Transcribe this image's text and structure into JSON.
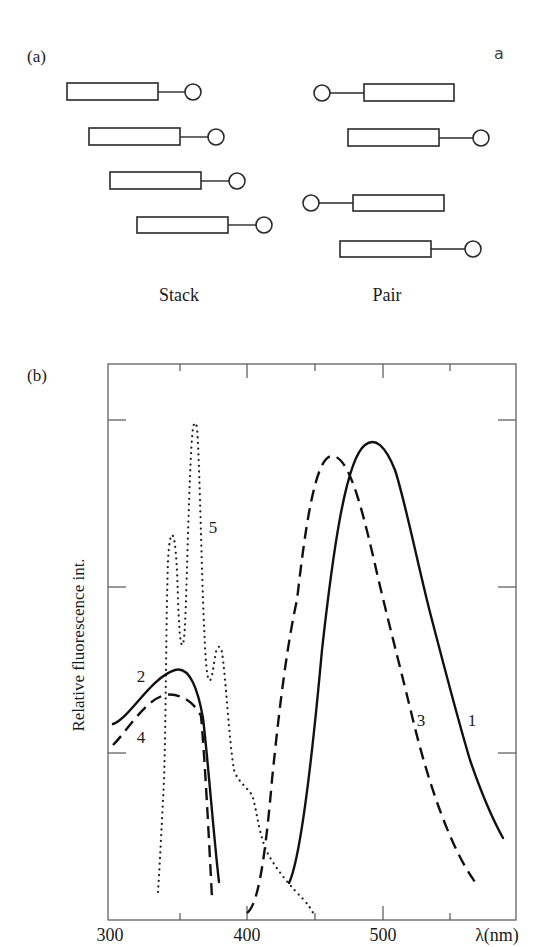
{
  "panel_a": {
    "label": "(a)",
    "corner_mark": "a",
    "stack_caption": "Stack",
    "pair_caption": "Pair",
    "stack_units": [
      {
        "rect": [
          67,
          83,
          91,
          17
        ],
        "bead": [
          193,
          92
        ],
        "bead_side": "right"
      },
      {
        "rect": [
          89,
          128,
          91,
          17
        ],
        "bead": [
          216,
          137
        ],
        "bead_side": "right"
      },
      {
        "rect": [
          110,
          172,
          91,
          17
        ],
        "bead": [
          237,
          181
        ],
        "bead_side": "right"
      },
      {
        "rect": [
          137,
          217,
          91,
          16
        ],
        "bead": [
          264,
          225
        ],
        "bead_side": "right"
      }
    ],
    "pair_units": [
      {
        "rect": [
          364,
          84,
          90,
          17
        ],
        "bead": [
          322,
          93
        ],
        "bead_side": "left"
      },
      {
        "rect": [
          348,
          129,
          91,
          17
        ],
        "bead": [
          481,
          138
        ],
        "bead_side": "right"
      },
      {
        "rect": [
          353,
          195,
          91,
          16
        ],
        "bead": [
          311,
          203
        ],
        "bead_side": "left"
      },
      {
        "rect": [
          340,
          241,
          91,
          16
        ],
        "bead": [
          473,
          249
        ],
        "bead_side": "right"
      }
    ]
  },
  "panel_b": {
    "label": "(b)",
    "ylabel": "Relative fluorescence int.",
    "xlabel": "λ(nm)",
    "x_tick_labels": [
      "300",
      "400",
      "500"
    ],
    "curve_labels": [
      "1",
      "2",
      "3",
      "4",
      "5"
    ]
  },
  "chart_data": {
    "type": "line",
    "title": "",
    "xlabel": "λ(nm)",
    "ylabel": "Relative fluorescence int.",
    "xlim": [
      300,
      600
    ],
    "ylim": [
      0,
      3.33
    ],
    "x_ticks_major": [
      300,
      400,
      500
    ],
    "x_ticks_minor": [
      350,
      450,
      550
    ],
    "y_ticks": [
      1,
      2,
      3
    ],
    "y_tick_labels": [],
    "grid": false,
    "legend": "inline curve numbers",
    "series": [
      {
        "name": "1",
        "style": "solid",
        "x": [
          433,
          460,
          495,
          522,
          538,
          559,
          590
        ],
        "y": [
          0.22,
          1.8,
          2.87,
          2.4,
          1.8,
          1.2,
          0.49
        ]
      },
      {
        "name": "2",
        "style": "solid",
        "x": [
          304,
          330,
          351,
          369,
          382
        ],
        "y": [
          1.18,
          1.38,
          1.5,
          1.21,
          0.23
        ]
      },
      {
        "name": "3",
        "style": "dashed",
        "x": [
          402,
          419,
          439,
          465,
          507,
          524,
          570
        ],
        "y": [
          0.04,
          0.84,
          1.8,
          2.78,
          1.77,
          1.2,
          0.23
        ]
      },
      {
        "name": "4",
        "style": "dashed",
        "x": [
          304,
          325,
          343,
          369,
          376
        ],
        "y": [
          1.05,
          1.22,
          1.35,
          1.21,
          0.13
        ]
      },
      {
        "name": "5",
        "style": "dotted",
        "x": [
          337,
          342,
          347,
          354,
          364,
          375,
          382,
          395,
          419,
          451
        ],
        "y": [
          0.17,
          0.84,
          2.31,
          1.65,
          2.98,
          1.44,
          1.64,
          0.84,
          0.36,
          0.04
        ]
      }
    ]
  }
}
